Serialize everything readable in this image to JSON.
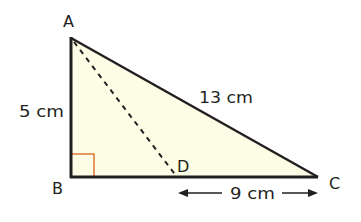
{
  "diagram": {
    "type": "right-triangle",
    "vertices": {
      "A": "A",
      "B": "B",
      "C": "C",
      "D": "D"
    },
    "measurements": {
      "AB": "5 cm",
      "AC": "13 cm",
      "DC": "9 cm"
    },
    "right_angle_at": "B",
    "dashed_segment": "AD",
    "colors": {
      "fill": "#fdfde6",
      "stroke": "#231f20",
      "right_angle_marker": "#e0763a"
    }
  }
}
